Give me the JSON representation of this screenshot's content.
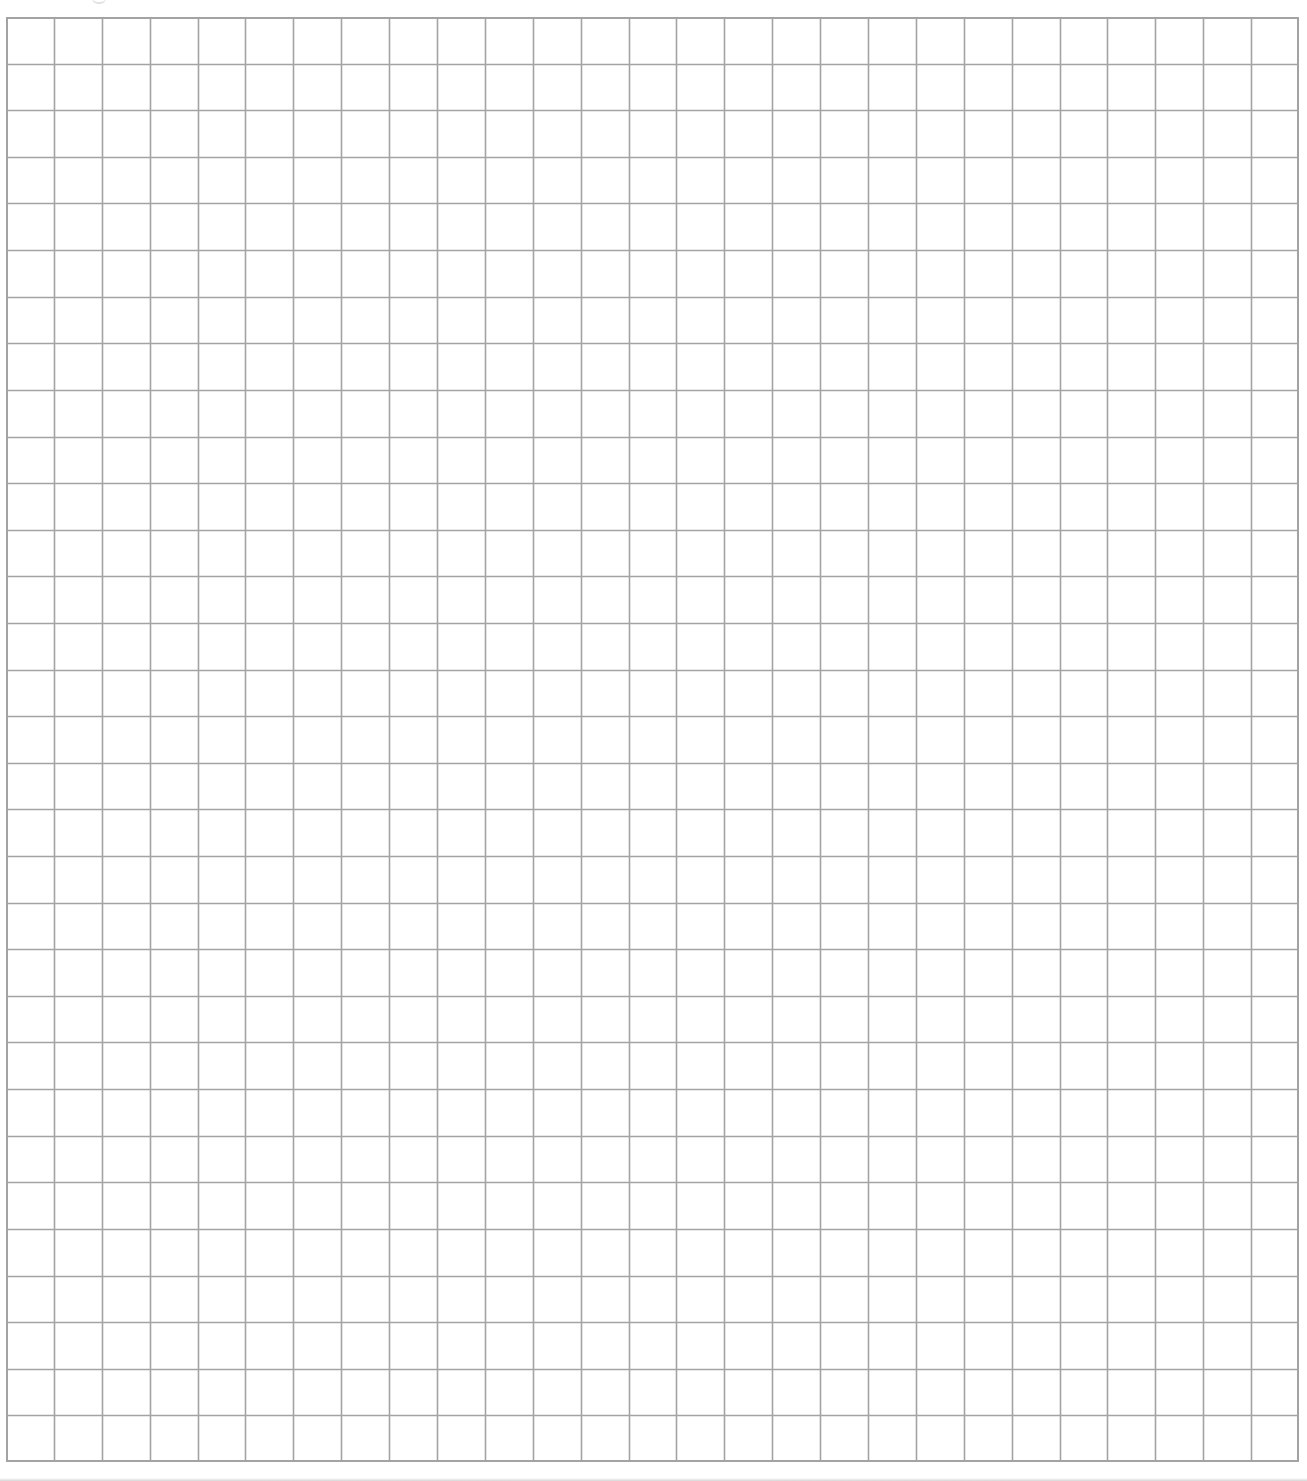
{
  "sheet": {
    "type": "graph-paper",
    "columns": 27,
    "rows": 31,
    "grid_left_px": 6,
    "grid_top_px": 17,
    "grid_width_px": 1293,
    "grid_height_px": 1445,
    "line_color": "#a3a3a3",
    "background_color": "#ffffff"
  }
}
